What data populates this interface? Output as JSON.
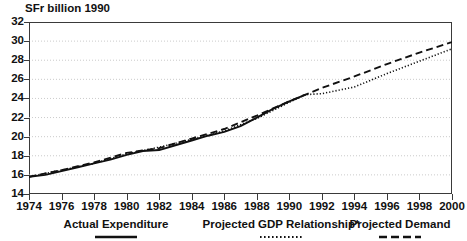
{
  "chart_data": {
    "type": "line",
    "title": "",
    "clipped_title": "",
    "ylabel": "SFr billion 1990",
    "xlabel": "",
    "ylim": [
      14,
      32
    ],
    "xlim": [
      1974,
      2000
    ],
    "yticks": [
      14,
      16,
      18,
      20,
      22,
      24,
      26,
      28,
      30,
      32
    ],
    "xticks": [
      1974,
      1976,
      1978,
      1980,
      1982,
      1984,
      1986,
      1988,
      1990,
      1992,
      1994,
      1996,
      1998,
      2000
    ],
    "grid": "horizontal-dotted",
    "legend_position": "bottom",
    "series": [
      {
        "name": "Actual Expenditure",
        "style": "solid",
        "color": "#111111",
        "x": [
          1974,
          1975,
          1976,
          1977,
          1978,
          1979,
          1980,
          1981,
          1982,
          1983,
          1984,
          1985,
          1986,
          1987,
          1988,
          1989,
          1990,
          1991
        ],
        "values": [
          15.8,
          16.0,
          16.4,
          16.8,
          17.2,
          17.6,
          18.1,
          18.5,
          18.6,
          19.1,
          19.6,
          20.1,
          20.5,
          21.1,
          22.0,
          22.9,
          23.7,
          24.4
        ]
      },
      {
        "name": "Projected GDP Relationship*",
        "style": "dotted",
        "color": "#111111",
        "x": [
          1974,
          1976,
          1978,
          1980,
          1982,
          1984,
          1986,
          1988,
          1990,
          1991,
          1992,
          1994,
          1996,
          1998,
          2000
        ],
        "values": [
          15.8,
          16.5,
          17.2,
          18.2,
          18.9,
          19.7,
          20.6,
          21.9,
          23.6,
          24.4,
          24.5,
          25.2,
          26.6,
          27.9,
          29.2
        ]
      },
      {
        "name": "Projected Demand",
        "style": "dashed",
        "color": "#111111",
        "x": [
          1974,
          1976,
          1978,
          1980,
          1982,
          1984,
          1986,
          1988,
          1990,
          1991,
          1992,
          1994,
          1996,
          1998,
          2000
        ],
        "values": [
          15.8,
          16.5,
          17.3,
          18.3,
          18.8,
          19.8,
          20.8,
          22.2,
          23.7,
          24.4,
          25.1,
          26.3,
          27.6,
          28.8,
          29.9
        ]
      }
    ]
  },
  "axis": {
    "unit_label": "SFr billion 1990",
    "ytick_labels": [
      "32",
      "30",
      "28",
      "26",
      "24",
      "22",
      "20",
      "18",
      "16",
      "14"
    ],
    "xtick_labels": [
      "1974",
      "1976",
      "1978",
      "1980",
      "1982",
      "1984",
      "1986",
      "1988",
      "1990",
      "1992",
      "1994",
      "1996",
      "1998",
      "2000"
    ]
  },
  "legend": {
    "items": [
      {
        "label": "Actual Expenditure",
        "style": "solid"
      },
      {
        "label": "Projected GDP Relationship*",
        "style": "dotted"
      },
      {
        "label": "Projected Demand",
        "style": "dashed"
      }
    ]
  }
}
